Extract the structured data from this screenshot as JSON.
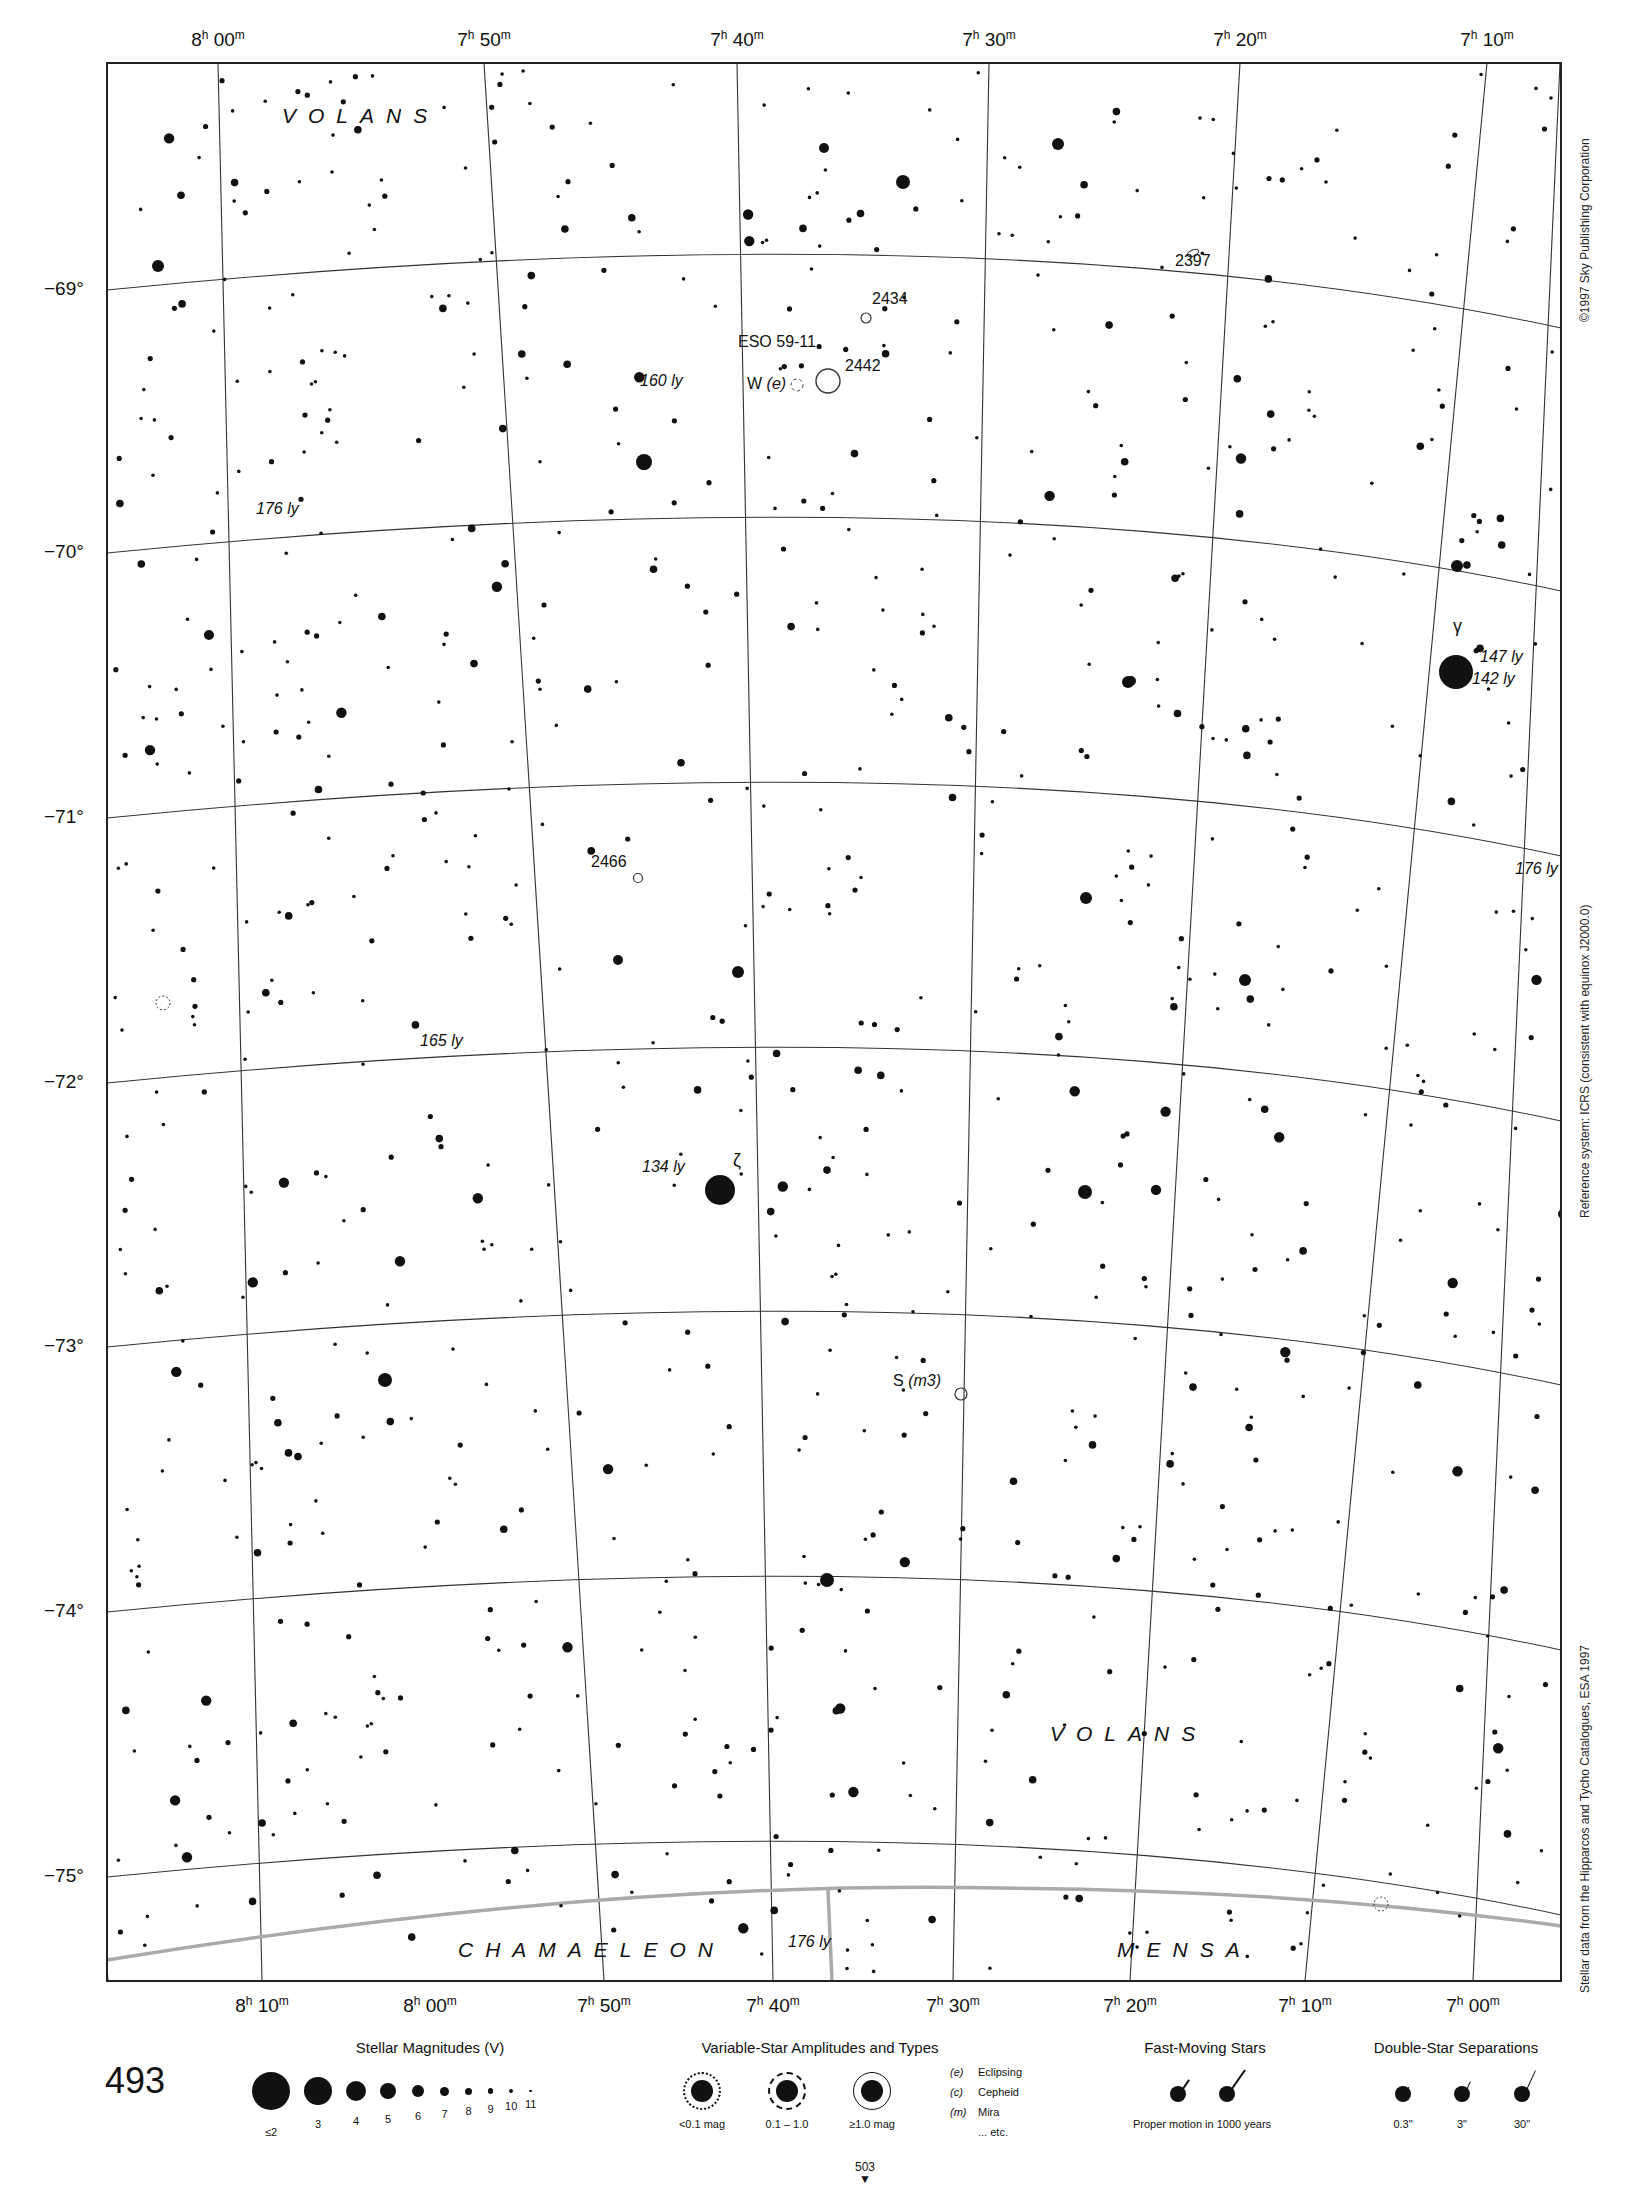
{
  "page": {
    "page_number": "493",
    "continues_to": "503",
    "credits": {
      "copyright": "©1997 Sky Publishing Corporation",
      "reference_system": "Reference system: ICRS (consistent with equinox J2000.0)",
      "data_source": "Stellar data from the Hipparcos and Tycho Catalogues, ESA 1997"
    }
  },
  "axes": {
    "ra_top": [
      {
        "h": "8",
        "m": "00",
        "x": 218
      },
      {
        "h": "7",
        "m": "50",
        "x": 484
      },
      {
        "h": "7",
        "m": "40",
        "x": 737
      },
      {
        "h": "7",
        "m": "30",
        "x": 989
      },
      {
        "h": "7",
        "m": "20",
        "x": 1240
      },
      {
        "h": "7",
        "m": "10",
        "x": 1487
      }
    ],
    "ra_bottom": [
      {
        "h": "8",
        "m": "10",
        "x": 262
      },
      {
        "h": "8",
        "m": "00",
        "x": 430
      },
      {
        "h": "7",
        "m": "50",
        "x": 604
      },
      {
        "h": "7",
        "m": "40",
        "x": 773
      },
      {
        "h": "7",
        "m": "30",
        "x": 953
      },
      {
        "h": "7",
        "m": "20",
        "x": 1130
      },
      {
        "h": "7",
        "m": "10",
        "x": 1305
      },
      {
        "h": "7",
        "m": "00",
        "x": 1473
      }
    ],
    "dec": [
      {
        "label": "−69°",
        "y": 290
      },
      {
        "label": "−70°",
        "y": 553
      },
      {
        "label": "−71°",
        "y": 818
      },
      {
        "label": "−72°",
        "y": 1083
      },
      {
        "label": "−73°",
        "y": 1347
      },
      {
        "label": "−74°",
        "y": 1612
      },
      {
        "label": "−75°",
        "y": 1877
      }
    ]
  },
  "constellations": [
    {
      "name": "VOLANS",
      "x": 282,
      "y": 104
    },
    {
      "name": "VOLANS",
      "x": 1050,
      "y": 1722
    },
    {
      "name": "CHAMAELEON",
      "x": 458,
      "y": 1938
    },
    {
      "name": "MENSA",
      "x": 1117,
      "y": 1938
    }
  ],
  "objects": [
    {
      "label": "2434",
      "x": 872,
      "y": 300,
      "type": "open-cluster"
    },
    {
      "label": "2442",
      "x": 845,
      "y": 367,
      "type": "open-cluster"
    },
    {
      "label": "ESO 59-11",
      "x": 738,
      "y": 343,
      "type": "galaxy"
    },
    {
      "label": "2397",
      "x": 1175,
      "y": 262,
      "type": "galaxy"
    },
    {
      "label": "2466",
      "x": 591,
      "y": 863,
      "type": "open-cluster"
    }
  ],
  "star_labels": [
    {
      "text": "γ",
      "x": 1453,
      "y": 626,
      "italic": false
    },
    {
      "text": "147 ly",
      "x": 1480,
      "y": 658,
      "italic": true
    },
    {
      "text": "142 ly",
      "x": 1472,
      "y": 680,
      "italic": true
    },
    {
      "text": "176 ly",
      "x": 1515,
      "y": 870,
      "italic": true
    },
    {
      "text": "ζ",
      "x": 733,
      "y": 1160,
      "italic": false
    },
    {
      "text": "134 ly",
      "x": 642,
      "y": 1168,
      "italic": true
    },
    {
      "text": "176 ly",
      "x": 256,
      "y": 510,
      "italic": true
    },
    {
      "text": "160 ly",
      "x": 640,
      "y": 382,
      "italic": true
    },
    {
      "text": "165 ly",
      "x": 420,
      "y": 1042,
      "italic": true
    },
    {
      "text": "176 ly",
      "x": 788,
      "y": 1943,
      "italic": true
    }
  ],
  "variable_labels": [
    {
      "name": "W",
      "type": "(e)",
      "x": 747,
      "y": 385
    },
    {
      "name": "S",
      "type": "(m3)",
      "x": 893,
      "y": 1382
    }
  ],
  "legend": {
    "magnitudes": {
      "title": "Stellar Magnitudes (V)",
      "items": [
        {
          "label": "≤2",
          "r": 19
        },
        {
          "label": "3",
          "r": 14
        },
        {
          "label": "4",
          "r": 10
        },
        {
          "label": "5",
          "r": 8
        },
        {
          "label": "6",
          "r": 6
        },
        {
          "label": "7",
          "r": 4.5
        },
        {
          "label": "8",
          "r": 3.5
        },
        {
          "label": "9",
          "r": 2.6
        },
        {
          "label": "10",
          "r": 2
        },
        {
          "label": "11",
          "r": 1.4
        }
      ]
    },
    "variables": {
      "title": "Variable-Star Amplitudes and Types",
      "amplitudes": [
        "<0.1 mag",
        "0.1 – 1.0",
        "≥1.0 mag"
      ],
      "types": [
        {
          "code": "(e)",
          "name": "Eclipsing"
        },
        {
          "code": "(c)",
          "name": "Cepheid"
        },
        {
          "code": "(m)",
          "name": "Mira"
        },
        {
          "code": "",
          "name": "... etc."
        }
      ]
    },
    "fast_moving": {
      "title": "Fast-Moving Stars",
      "caption": "Proper motion in 1000 years"
    },
    "double_stars": {
      "title": "Double-Star Separations",
      "items": [
        "0.3\"",
        "3\"",
        "30\""
      ]
    }
  }
}
